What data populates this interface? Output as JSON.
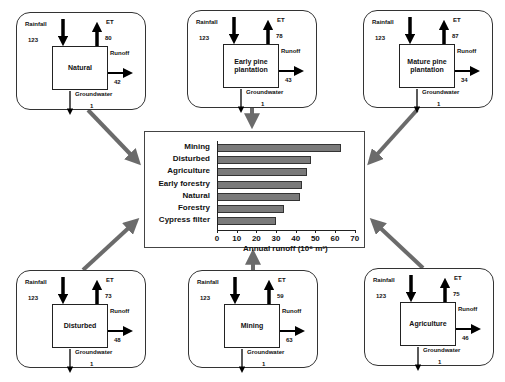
{
  "panels": [
    {
      "id": "natural",
      "title": "Natural",
      "rainfall_label": "Rainfall",
      "rainfall": "123",
      "et_label": "ET",
      "et": "80",
      "runoff_label": "Runoff",
      "runoff": "42",
      "gw_label": "Groundwater",
      "gw": "1"
    },
    {
      "id": "early-pine",
      "title": "Early pine plantation",
      "rainfall_label": "Rainfall",
      "rainfall": "123",
      "et_label": "ET",
      "et": "78",
      "runoff_label": "Runoff",
      "runoff": "43",
      "gw_label": "Groundwater",
      "gw": "1"
    },
    {
      "id": "mature-pine",
      "title": "Mature pine plantation",
      "rainfall_label": "Rainfall",
      "rainfall": "123",
      "et_label": "ET",
      "et": "87",
      "runoff_label": "Runoff",
      "runoff": "34",
      "gw_label": "Groundwater",
      "gw": "1"
    },
    {
      "id": "disturbed",
      "title": "Disturbed",
      "rainfall_label": "Rainfall",
      "rainfall": "123",
      "et_label": "ET",
      "et": "73",
      "runoff_label": "Runoff",
      "runoff": "48",
      "gw_label": "Groundwater",
      "gw": "1"
    },
    {
      "id": "mining",
      "title": "Mining",
      "rainfall_label": "Rainfall",
      "rainfall": "123",
      "et_label": "ET",
      "et": "59",
      "runoff_label": "Runoff",
      "runoff": "63",
      "gw_label": "Groundwater",
      "gw": "1"
    },
    {
      "id": "agriculture",
      "title": "Agriculture",
      "rainfall_label": "Rainfall",
      "rainfall": "123",
      "et_label": "ET",
      "et": "75",
      "runoff_label": "Runoff",
      "runoff": "46",
      "gw_label": "Groundwater",
      "gw": "1"
    }
  ],
  "colors": {
    "bar": "#7a7a7a",
    "connector": "#6b6b6b",
    "outline": "#333333"
  },
  "chart_data": {
    "type": "bar",
    "orientation": "horizontal",
    "categories": [
      "Mining",
      "Disturbed",
      "Agriculture",
      "Early forestry",
      "Natural",
      "Forestry",
      "Cypress filter"
    ],
    "values": [
      63,
      48,
      46,
      43,
      42,
      34,
      30
    ],
    "title": "",
    "xlabel": "Annual runoff (10⁶ m³)",
    "ylabel": "",
    "xlim": [
      0,
      70
    ],
    "xticks": [
      "0",
      "10",
      "20",
      "30",
      "40",
      "50",
      "60",
      "70"
    ],
    "grid": false,
    "legend": null
  }
}
